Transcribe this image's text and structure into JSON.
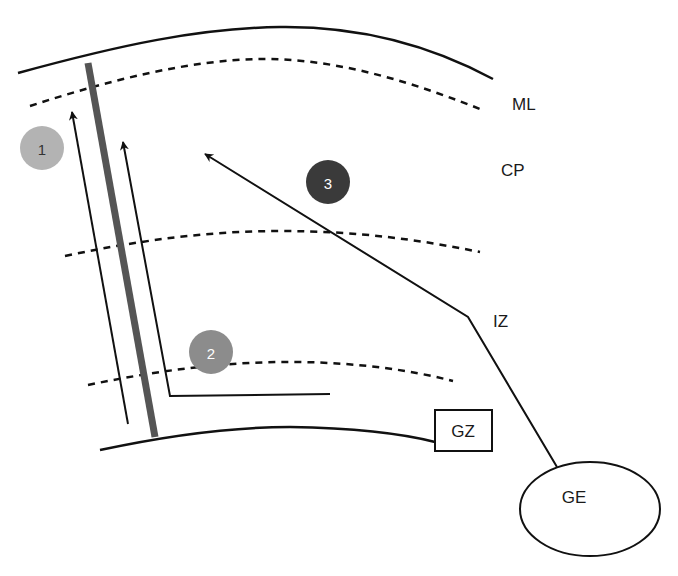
{
  "diagram": {
    "layers": {
      "ml": "ML",
      "cp": "CP",
      "iz": "IZ"
    },
    "regions": {
      "gz": "GZ",
      "ge": "GE"
    },
    "markers": [
      {
        "label": "1",
        "color": "#b3b3b3"
      },
      {
        "label": "2",
        "color": "#8c8c8c"
      },
      {
        "label": "3",
        "color": "#3a3a3a"
      }
    ],
    "colors": {
      "line": "#111111",
      "radial_glia": "#555555"
    }
  }
}
